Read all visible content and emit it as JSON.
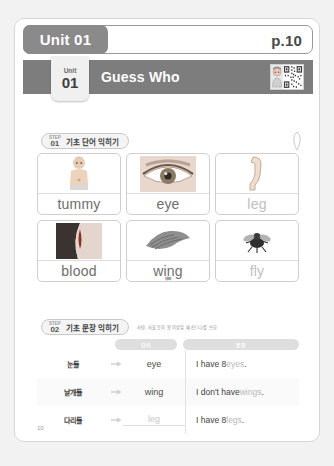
{
  "header": {
    "unit_badge": "Unit 01",
    "page_ref": "p.10"
  },
  "banner": {
    "tab_label": "Unit",
    "tab_number": "01",
    "title": "Guess Who",
    "qr_icon": "qr-code-icon"
  },
  "step1": {
    "step_caption": "STEP",
    "step_number": "01",
    "label": "기초 단어 익히기",
    "pencil_icon": "pencil-icon",
    "cards": [
      {
        "word": "tummy",
        "korean": "배",
        "image": "toddler-belly-photo",
        "faint": false
      },
      {
        "word": "eye",
        "korean": "눈",
        "image": "human-eye-photo",
        "faint": false
      },
      {
        "word": "leg",
        "korean": "다리",
        "image": "leg-illustration",
        "faint": true
      },
      {
        "word": "blood",
        "korean": "피",
        "image": "blood-photo",
        "faint": false
      },
      {
        "word": "wing",
        "korean": "날개",
        "image": "wing-photo",
        "faint": false
      },
      {
        "word": "fly",
        "korean": "파리",
        "image": "fly-insect-photo",
        "faint": true
      }
    ]
  },
  "step2": {
    "step_caption": "STEP",
    "step_number": "02",
    "label": "기초 문장 익히기",
    "note": "사람, 사물 등이 몸 이상일 때 (단/니/를 쓰요.",
    "columns": {
      "word": "단어",
      "sentence": "문장"
    },
    "rows": [
      {
        "korean": "눈들",
        "word": "eye",
        "word_blank": false,
        "sentence_prefix": "I have 8 ",
        "sentence_highlight": "eyes",
        "sentence_suffix": "."
      },
      {
        "korean": "날개들",
        "word": "wing",
        "word_blank": false,
        "sentence_prefix": "I don't have ",
        "sentence_highlight": "wings",
        "sentence_suffix": "."
      },
      {
        "korean": "다리들",
        "word": "leg",
        "word_blank": true,
        "sentence_prefix": "I have 8 ",
        "sentence_highlight": "legs",
        "sentence_suffix": "."
      }
    ]
  },
  "footer": {
    "page_number": "10"
  }
}
